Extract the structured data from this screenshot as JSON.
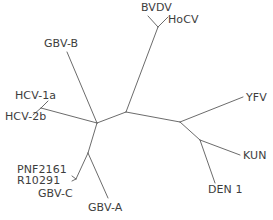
{
  "figure": {
    "type": "unrooted-phylogenetic-tree",
    "width": 273,
    "height": 220,
    "background_color": "#ffffff",
    "line_color": "#5a5a5a",
    "text_color": "#3d3d3d"
  },
  "taxa": [
    {
      "id": "bvdv",
      "label": "BVDV",
      "x": 141,
      "y": 2
    },
    {
      "id": "hocv",
      "label": "HoCV",
      "x": 168,
      "y": 14
    },
    {
      "id": "gbv_b",
      "label": "GBV-B",
      "x": 44,
      "y": 38
    },
    {
      "id": "hcv_1a",
      "label": "HCV-1a",
      "x": 15,
      "y": 90
    },
    {
      "id": "hcv_2b",
      "label": "HCV-2b",
      "x": 5,
      "y": 111
    },
    {
      "id": "yfv",
      "label": "YFV",
      "x": 246,
      "y": 92
    },
    {
      "id": "kun",
      "label": "KUN",
      "x": 243,
      "y": 150
    },
    {
      "id": "pnf2161",
      "label": "PNF2161",
      "x": 17,
      "y": 164
    },
    {
      "id": "r10291",
      "label": "R10291",
      "x": 17,
      "y": 175
    },
    {
      "id": "gbv_c",
      "label": "GBV-C",
      "x": 38,
      "y": 188
    },
    {
      "id": "gbv_a",
      "label": "GBV-A",
      "x": 88,
      "y": 202
    },
    {
      "id": "den_1",
      "label": "DEN 1",
      "x": 208,
      "y": 184
    }
  ],
  "chart_data": {
    "type": "tree",
    "title": "",
    "layout": "unrooted",
    "nodes": [
      {
        "id": "n_center_left",
        "x": 97,
        "y": 123,
        "kind": "internal"
      },
      {
        "id": "n_center_right",
        "x": 126,
        "y": 112,
        "kind": "internal"
      },
      {
        "id": "n_flavi",
        "x": 180,
        "y": 122,
        "kind": "internal"
      },
      {
        "id": "n_kun_den",
        "x": 200,
        "y": 140,
        "kind": "internal"
      },
      {
        "id": "n_pesti",
        "x": 158,
        "y": 27,
        "kind": "internal"
      },
      {
        "id": "n_hcv",
        "x": 41,
        "y": 108,
        "kind": "internal"
      },
      {
        "id": "n_gbv_ac",
        "x": 88,
        "y": 153,
        "kind": "internal"
      },
      {
        "id": "n_gbv_c",
        "x": 76,
        "y": 179,
        "kind": "internal"
      },
      {
        "id": "t_bvdv",
        "x": 148,
        "y": 16,
        "kind": "tip",
        "taxon": "bvdv"
      },
      {
        "id": "t_hocv",
        "x": 168,
        "y": 17,
        "kind": "tip",
        "taxon": "hocv"
      },
      {
        "id": "t_gbv_b",
        "x": 67,
        "y": 52,
        "kind": "tip",
        "taxon": "gbv_b"
      },
      {
        "id": "t_hcv_1a",
        "x": 48,
        "y": 101,
        "kind": "tip",
        "taxon": "hcv_1a"
      },
      {
        "id": "t_hcv_2b",
        "x": 33,
        "y": 115,
        "kind": "tip",
        "taxon": "hcv_2b"
      },
      {
        "id": "t_yfv",
        "x": 243,
        "y": 97,
        "kind": "tip",
        "taxon": "yfv"
      },
      {
        "id": "t_kun",
        "x": 240,
        "y": 155,
        "kind": "tip",
        "taxon": "kun"
      },
      {
        "id": "t_den_1",
        "x": 215,
        "y": 183,
        "kind": "tip",
        "taxon": "den_1"
      },
      {
        "id": "t_gbv_a",
        "x": 108,
        "y": 198,
        "kind": "tip",
        "taxon": "gbv_a"
      },
      {
        "id": "t_pnf2161",
        "x": 72,
        "y": 176,
        "kind": "tip",
        "taxon": "pnf2161"
      },
      {
        "id": "t_r10291",
        "x": 72,
        "y": 181,
        "kind": "tip",
        "taxon": "r10291"
      }
    ],
    "edges": [
      {
        "from": "n_center_left",
        "to": "n_center_right"
      },
      {
        "from": "n_center_right",
        "to": "n_pesti"
      },
      {
        "from": "n_center_right",
        "to": "n_flavi"
      },
      {
        "from": "n_pesti",
        "to": "t_bvdv"
      },
      {
        "from": "n_pesti",
        "to": "t_hocv"
      },
      {
        "from": "n_flavi",
        "to": "t_yfv"
      },
      {
        "from": "n_flavi",
        "to": "n_kun_den"
      },
      {
        "from": "n_kun_den",
        "to": "t_kun"
      },
      {
        "from": "n_kun_den",
        "to": "t_den_1"
      },
      {
        "from": "n_center_left",
        "to": "t_gbv_b"
      },
      {
        "from": "n_center_left",
        "to": "n_hcv"
      },
      {
        "from": "n_hcv",
        "to": "t_hcv_1a"
      },
      {
        "from": "n_hcv",
        "to": "t_hcv_2b"
      },
      {
        "from": "n_center_left",
        "to": "n_gbv_ac"
      },
      {
        "from": "n_gbv_ac",
        "to": "t_gbv_a"
      },
      {
        "from": "n_gbv_ac",
        "to": "n_gbv_c"
      },
      {
        "from": "n_gbv_c",
        "to": "t_pnf2161"
      },
      {
        "from": "n_gbv_c",
        "to": "t_r10291"
      }
    ],
    "leaf_labels": [
      "BVDV",
      "HoCV",
      "GBV-B",
      "HCV-1a",
      "HCV-2b",
      "YFV",
      "KUN",
      "DEN 1",
      "GBV-A",
      "GBV-C",
      "PNF2161",
      "R10291"
    ],
    "xlabel": "",
    "ylabel": "",
    "legend": [],
    "grid": false
  }
}
